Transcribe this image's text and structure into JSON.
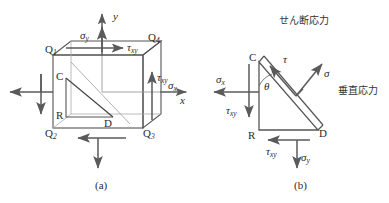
{
  "figure": {
    "colors": {
      "line": "#555555",
      "arrow": "#5a5a5a",
      "text": "#2b2b2b",
      "background": "#ffffff"
    },
    "captions": {
      "a": "(a)",
      "b": "(b)"
    }
  },
  "panel_a": {
    "name": "stress-cube",
    "axes": {
      "x_label": "x",
      "y_label": "y"
    },
    "corners": {
      "q1": "Q",
      "q1_sub": "1",
      "q2": "Q",
      "q2_sub": "2",
      "q3": "Q",
      "q3_sub": "3",
      "q4": "Q",
      "q4_sub": "4"
    },
    "cut_vertices": {
      "c": "C",
      "r": "R",
      "d": "D"
    },
    "stresses": {
      "sigma_y_top": "σ",
      "sigma_y_top_sub": "y",
      "sigma_x_right": "σ",
      "sigma_x_right_sub": "x",
      "tau_top": "τ",
      "tau_top_sub": "xy",
      "tau_right": "τ",
      "tau_right_sub": "xy"
    }
  },
  "panel_b": {
    "name": "stress-wedge",
    "vertices": {
      "c": "C",
      "r": "R",
      "d": "D"
    },
    "angle_label": "θ",
    "stresses": {
      "tau_incline": "τ",
      "sigma_normal": "σ",
      "sigma_x": "σ",
      "sigma_x_sub": "x",
      "sigma_y": "σ",
      "sigma_y_sub": "y",
      "tau_xy_left": "τ",
      "tau_xy_left_sub": "xy",
      "tau_xy_bottom": "τ",
      "tau_xy_bottom_sub": "xy"
    },
    "annotations": {
      "shear_stress": "せん断応力",
      "normal_stress": "垂直応力"
    }
  }
}
